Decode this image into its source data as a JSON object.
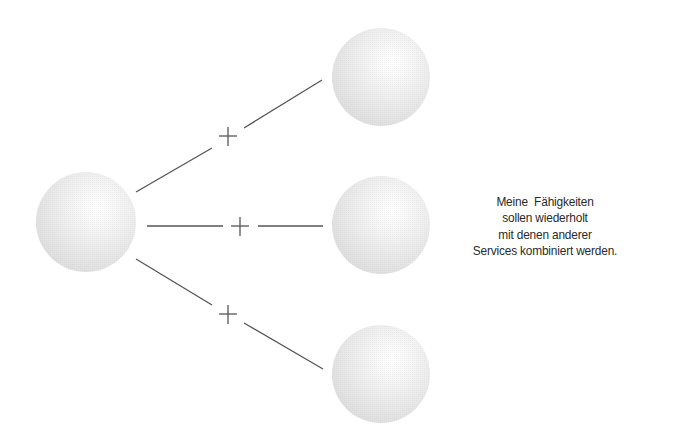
{
  "diagram": {
    "nodes": [
      {
        "id": "source",
        "cx": 86,
        "cy": 222,
        "r": 50
      },
      {
        "id": "target-top",
        "cx": 381,
        "cy": 77,
        "r": 49
      },
      {
        "id": "target-middle",
        "cx": 381,
        "cy": 225,
        "r": 49
      },
      {
        "id": "target-bottom",
        "cx": 381,
        "cy": 374,
        "r": 49
      }
    ],
    "connectors": [
      {
        "id": "top",
        "seg1": [
          136,
          192,
          212,
          148
        ],
        "seg2": [
          244,
          128,
          322,
          80
        ],
        "plus": [
          228,
          136
        ],
        "symbol": "+"
      },
      {
        "id": "middle",
        "seg1": [
          147,
          226,
          223,
          226
        ],
        "seg2": [
          258,
          226,
          323,
          226
        ],
        "plus": [
          240,
          226
        ],
        "symbol": "+"
      },
      {
        "id": "bottom",
        "seg1": [
          136,
          259,
          212,
          305
        ],
        "seg2": [
          244,
          323,
          323,
          369
        ],
        "plus": [
          228,
          314
        ],
        "symbol": "+"
      }
    ],
    "colors": {
      "sphere_light": "#ffffff",
      "sphere_mid": "#ececec",
      "sphere_dark": "#d9d9d9",
      "line": "#555555"
    }
  },
  "caption": {
    "lines": [
      "Meine  Fähigkeiten",
      "sollen wiederholt",
      "mit denen anderer",
      "Services kombiniert werden."
    ]
  }
}
